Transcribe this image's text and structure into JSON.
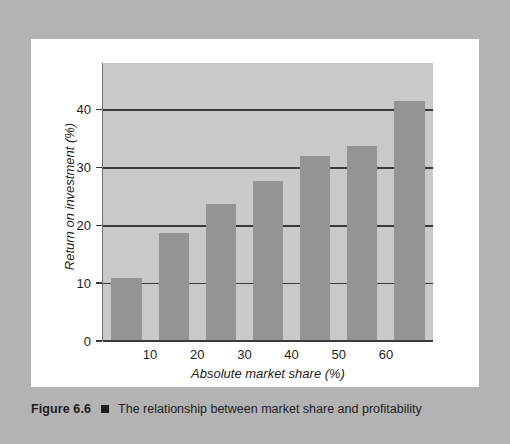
{
  "caption": {
    "figure_number": "Figure 6.6",
    "marker": "square-bullet",
    "text": "The relationship between market share and profitability"
  },
  "colors": {
    "frame": "#b3b3b3",
    "page": "#ffffff",
    "plot_background": "#c9c9c9",
    "bar": "#949494",
    "gridline": "#3a3a3a",
    "text": "#1d1d1d"
  },
  "chart_data": {
    "type": "bar",
    "title": "",
    "subtitle": "",
    "xlabel": "Absolute market share (%)",
    "ylabel": "Return on investment (%)",
    "categories": [
      "10",
      "20",
      "30",
      "40",
      "50",
      "60",
      "70"
    ],
    "tick_categories": [
      "10",
      "20",
      "30",
      "40",
      "50",
      "60"
    ],
    "values": [
      10.8,
      18.7,
      23.6,
      27.7,
      32.0,
      33.7,
      41.5
    ],
    "xlim": [
      0,
      7
    ],
    "ylim": [
      0,
      48
    ],
    "yticks": [
      0,
      10,
      20,
      30,
      40
    ],
    "ytick_labels": [
      "0",
      "10",
      "20",
      "30",
      "40"
    ],
    "grid": "horizontal",
    "gridline_values": [
      10,
      20,
      30,
      40
    ],
    "legend": "none",
    "series": [
      {
        "name": "Return on investment",
        "values": [
          10.8,
          18.7,
          23.6,
          27.7,
          32.0,
          33.7,
          41.5
        ]
      }
    ]
  }
}
